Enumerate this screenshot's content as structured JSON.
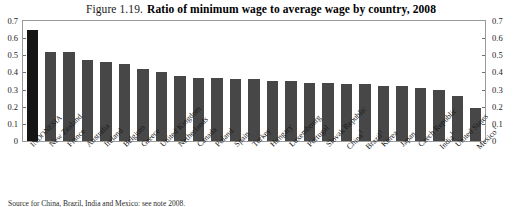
{
  "figure": {
    "number": "Figure 1.19.",
    "title": "Ratio of minimum wage to average wage by country, 2008"
  },
  "source_note": "Source for China, Brazil, India and Mexico: see note 2008.",
  "axis": {
    "ticks": [
      "0.7",
      "0.6",
      "0.5",
      "0.4",
      "0.3",
      "0.2",
      "0.1",
      "0"
    ]
  },
  "colors": {
    "bar": "#474747",
    "highlight_bar": "#151515",
    "frame": "#9a9a9a"
  },
  "chart_data": {
    "type": "bar",
    "title": "Ratio of minimum wage to average wage by country, 2008",
    "xlabel": "",
    "ylabel": "",
    "ylim": [
      0,
      0.7
    ],
    "ytick_values": [
      0,
      0.1,
      0.2,
      0.3,
      0.4,
      0.5,
      0.6,
      0.7
    ],
    "grid": false,
    "legend": "none",
    "dual_axis": true,
    "highlight_category": "INDONESIA",
    "categories": [
      "INDONESIA",
      "New Zealand",
      "France",
      "Australia",
      "Ireland",
      "Belgium",
      "Greece",
      "United Kingdom",
      "Netherlands",
      "Canada",
      "Poland",
      "Spain",
      "Turkey",
      "Hungary",
      "Luxembourg",
      "Portugal",
      "Slovak Republic",
      "China",
      "Brazil",
      "Korea",
      "Japan",
      "Czech Republic",
      "India",
      "United States",
      "Mexico"
    ],
    "category_footnotes": {
      "China": "1",
      "Brazil": "1",
      "India": "1",
      "Mexico": "1"
    },
    "values": [
      0.65,
      0.52,
      0.52,
      0.47,
      0.46,
      0.45,
      0.42,
      0.4,
      0.38,
      0.37,
      0.37,
      0.36,
      0.36,
      0.35,
      0.35,
      0.34,
      0.34,
      0.33,
      0.33,
      0.32,
      0.32,
      0.31,
      0.3,
      0.26,
      0.19
    ]
  }
}
